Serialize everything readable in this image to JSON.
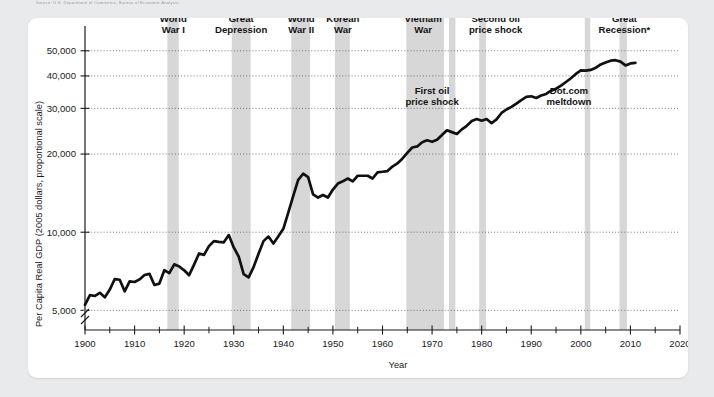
{
  "source_note": "Source: U.S. Department of Commerce, Bureau of Economic Analysis.",
  "axes": {
    "ylabel": "Per Capita Real GDP (2005 dollars, proportional scale)",
    "xlabel": "Year",
    "y_ticks": [
      "5,000",
      "10,000",
      "20,000",
      "30,000",
      "40,000",
      "50,000"
    ],
    "x_ticks": [
      "1900",
      "1910",
      "1920",
      "1930",
      "1940",
      "1950",
      "1960",
      "1970",
      "1980",
      "1990",
      "2000",
      "2010",
      "2020"
    ]
  },
  "annotations_top": [
    {
      "id": "world-war-i",
      "line1": "World",
      "line2": "War I"
    },
    {
      "id": "great-depression",
      "line1": "Great",
      "line2": "Depression"
    },
    {
      "id": "world-war-ii",
      "line1": "World",
      "line2": "War II"
    },
    {
      "id": "korean-war",
      "line1": "Korean",
      "line2": "War"
    },
    {
      "id": "vietnam-war",
      "line1": "Vietnam",
      "line2": "War"
    },
    {
      "id": "second-oil-price-shock",
      "line1": "Second oil",
      "line2": "price shock"
    },
    {
      "id": "great-recession",
      "line1": "Great",
      "line2": "Recession*"
    }
  ],
  "annotations_inner": [
    {
      "id": "first-oil-price-shock",
      "line1": "First oil",
      "line2": "price shock"
    },
    {
      "id": "dotcom-meltdown",
      "line1": "Dot.com",
      "line2": "meltdown"
    }
  ],
  "colors": {
    "band": "#d7d7d7",
    "line": "#111111",
    "card": "#ffffff",
    "page": "#e9eaec"
  },
  "chart_data": {
    "type": "line",
    "title": "",
    "xlabel": "Year",
    "ylabel": "Per Capita Real GDP (2005 dollars, proportional scale)",
    "yscale": "log",
    "xlim": [
      1900,
      2020
    ],
    "ylim": [
      4200,
      56000
    ],
    "grid": true,
    "legend": "none",
    "y_axis_break": true,
    "x": [
      1900,
      1901,
      1902,
      1903,
      1904,
      1905,
      1906,
      1907,
      1908,
      1909,
      1910,
      1911,
      1912,
      1913,
      1914,
      1915,
      1916,
      1917,
      1918,
      1919,
      1920,
      1921,
      1922,
      1923,
      1924,
      1925,
      1926,
      1927,
      1928,
      1929,
      1930,
      1931,
      1932,
      1933,
      1934,
      1935,
      1936,
      1937,
      1938,
      1939,
      1940,
      1941,
      1942,
      1943,
      1944,
      1945,
      1946,
      1947,
      1948,
      1949,
      1950,
      1951,
      1952,
      1953,
      1954,
      1955,
      1956,
      1957,
      1958,
      1959,
      1960,
      1961,
      1962,
      1963,
      1964,
      1965,
      1966,
      1967,
      1968,
      1969,
      1970,
      1971,
      1972,
      1973,
      1974,
      1975,
      1976,
      1977,
      1978,
      1979,
      1980,
      1981,
      1982,
      1983,
      1984,
      1985,
      1986,
      1987,
      1988,
      1989,
      1990,
      1991,
      1992,
      1993,
      1994,
      1995,
      1996,
      1997,
      1998,
      1999,
      2000,
      2001,
      2002,
      2003,
      2004,
      2005,
      2006,
      2007,
      2008,
      2009,
      2010,
      2011
    ],
    "series": [
      {
        "name": "Per Capita Real GDP",
        "values": [
          5250,
          5720,
          5680,
          5840,
          5610,
          6010,
          6600,
          6560,
          5920,
          6470,
          6430,
          6580,
          6840,
          6910,
          6260,
          6340,
          7140,
          6960,
          7520,
          7380,
          7130,
          6830,
          7500,
          8280,
          8180,
          8840,
          9240,
          9180,
          9140,
          9750,
          8740,
          8050,
          6900,
          6700,
          7340,
          8260,
          9240,
          9620,
          9050,
          9650,
          10300,
          11900,
          13800,
          15900,
          16800,
          16300,
          14000,
          13600,
          13900,
          13600,
          14600,
          15400,
          15700,
          16100,
          15700,
          16500,
          16500,
          16500,
          16100,
          17000,
          17100,
          17200,
          17900,
          18400,
          19200,
          20200,
          21200,
          21400,
          22200,
          22600,
          22300,
          22700,
          23700,
          24700,
          24300,
          23900,
          24900,
          25700,
          26800,
          27300,
          26900,
          27300,
          26300,
          27200,
          28800,
          29700,
          30400,
          31300,
          32300,
          33200,
          33400,
          32900,
          33600,
          34100,
          35100,
          35700,
          36700,
          37900,
          39200,
          40700,
          42000,
          41900,
          42200,
          43000,
          44300,
          45100,
          45800,
          46000,
          45400,
          43900,
          44700,
          44900
        ]
      }
    ],
    "shaded_bands": [
      {
        "label": "World War I",
        "start": 1916.6,
        "end": 1918.9
      },
      {
        "label": "Great Depression",
        "start": 1929.6,
        "end": 1933.4
      },
      {
        "label": "World War II",
        "start": 1941.6,
        "end": 1945.4
      },
      {
        "label": "Korean War",
        "start": 1950.4,
        "end": 1953.4
      },
      {
        "label": "Vietnam War",
        "start": 1964.8,
        "end": 1972.4
      },
      {
        "label": "First oil price shock",
        "start": 1973.4,
        "end": 1974.7
      },
      {
        "label": "Second oil price shock",
        "start": 1979.5,
        "end": 1980.9
      },
      {
        "label": "Dot.com meltdown",
        "start": 2000.8,
        "end": 2001.9
      },
      {
        "label": "Great Recession",
        "start": 2007.8,
        "end": 2009.3
      }
    ]
  }
}
